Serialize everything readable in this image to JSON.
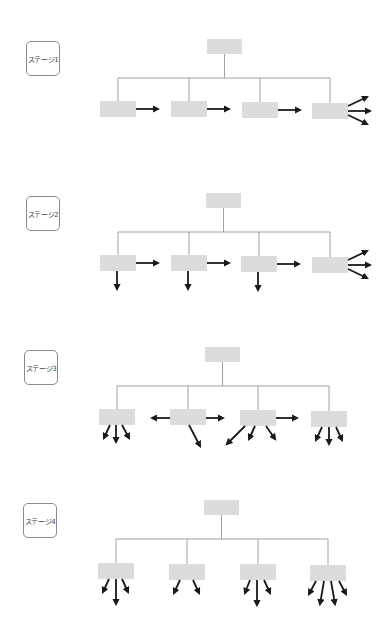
{
  "colors": {
    "node_fill": "#dcdcdc",
    "connector": "#8c8c8c",
    "arrow": "#1a1a1a",
    "label_border": "#8a8a8a",
    "label_text": "#444444"
  },
  "stages": [
    {
      "label": "ステージ1",
      "top": 0,
      "label_box": {
        "x": 26,
        "y": 41
      },
      "root": {
        "x": 207,
        "y": 39,
        "w": 35,
        "h": 15
      },
      "bus_y": 78,
      "children": [
        {
          "x": 100,
          "y": 101,
          "w": 36,
          "h": 16
        },
        {
          "x": 171,
          "y": 101,
          "w": 36,
          "h": 16
        },
        {
          "x": 242,
          "y": 102,
          "w": 36,
          "h": 16
        },
        {
          "x": 312,
          "y": 103,
          "w": 36,
          "h": 16
        }
      ],
      "arrows": [
        {
          "x1": 136,
          "y1": 109,
          "x2": 158,
          "y2": 109
        },
        {
          "x1": 207,
          "y1": 109,
          "x2": 229,
          "y2": 109
        },
        {
          "x1": 278,
          "y1": 110,
          "x2": 300,
          "y2": 110
        },
        {
          "x1": 348,
          "y1": 106,
          "x2": 367,
          "y2": 97
        },
        {
          "x1": 348,
          "y1": 111,
          "x2": 370,
          "y2": 111
        },
        {
          "x1": 348,
          "y1": 115,
          "x2": 367,
          "y2": 124
        }
      ]
    },
    {
      "label": "ステージ2",
      "top": 0,
      "label_box": {
        "x": 26,
        "y": 196
      },
      "root": {
        "x": 206,
        "y": 193,
        "w": 35,
        "h": 15
      },
      "bus_y": 232,
      "children": [
        {
          "x": 100,
          "y": 255,
          "w": 36,
          "h": 16
        },
        {
          "x": 171,
          "y": 255,
          "w": 36,
          "h": 16
        },
        {
          "x": 241,
          "y": 256,
          "w": 36,
          "h": 16
        },
        {
          "x": 312,
          "y": 257,
          "w": 36,
          "h": 16
        }
      ],
      "arrows": [
        {
          "x1": 136,
          "y1": 263,
          "x2": 158,
          "y2": 263
        },
        {
          "x1": 207,
          "y1": 263,
          "x2": 229,
          "y2": 263
        },
        {
          "x1": 277,
          "y1": 264,
          "x2": 299,
          "y2": 264
        },
        {
          "x1": 348,
          "y1": 260,
          "x2": 367,
          "y2": 251
        },
        {
          "x1": 348,
          "y1": 265,
          "x2": 370,
          "y2": 265
        },
        {
          "x1": 348,
          "y1": 269,
          "x2": 367,
          "y2": 278
        },
        {
          "x1": 117,
          "y1": 271,
          "x2": 117,
          "y2": 289
        },
        {
          "x1": 188,
          "y1": 271,
          "x2": 188,
          "y2": 289
        },
        {
          "x1": 258,
          "y1": 272,
          "x2": 258,
          "y2": 290
        }
      ]
    },
    {
      "label": "ステージ3",
      "top": 0,
      "label_box": {
        "x": 24,
        "y": 350
      },
      "root": {
        "x": 205,
        "y": 347,
        "w": 35,
        "h": 15
      },
      "bus_y": 386,
      "children": [
        {
          "x": 99,
          "y": 409,
          "w": 36,
          "h": 16
        },
        {
          "x": 170,
          "y": 409,
          "w": 36,
          "h": 16
        },
        {
          "x": 240,
          "y": 410,
          "w": 36,
          "h": 16
        },
        {
          "x": 311,
          "y": 411,
          "w": 36,
          "h": 16
        }
      ],
      "arrows": [
        {
          "x1": 110,
          "y1": 425,
          "x2": 104,
          "y2": 438
        },
        {
          "x1": 116,
          "y1": 425,
          "x2": 116,
          "y2": 442
        },
        {
          "x1": 122,
          "y1": 425,
          "x2": 129,
          "y2": 438
        },
        {
          "x1": 170,
          "y1": 418,
          "x2": 152,
          "y2": 418
        },
        {
          "x1": 206,
          "y1": 418,
          "x2": 223,
          "y2": 418
        },
        {
          "x1": 189,
          "y1": 425,
          "x2": 200,
          "y2": 446
        },
        {
          "x1": 276,
          "y1": 418,
          "x2": 297,
          "y2": 418
        },
        {
          "x1": 245,
          "y1": 426,
          "x2": 227,
          "y2": 444
        },
        {
          "x1": 255,
          "y1": 426,
          "x2": 249,
          "y2": 439
        },
        {
          "x1": 266,
          "y1": 426,
          "x2": 275,
          "y2": 439
        },
        {
          "x1": 322,
          "y1": 427,
          "x2": 316,
          "y2": 440
        },
        {
          "x1": 329,
          "y1": 427,
          "x2": 329,
          "y2": 444
        },
        {
          "x1": 336,
          "y1": 427,
          "x2": 342,
          "y2": 440
        }
      ]
    },
    {
      "label": "ステージ4",
      "top": 0,
      "label_box": {
        "x": 23,
        "y": 503
      },
      "root": {
        "x": 204,
        "y": 500,
        "w": 35,
        "h": 15
      },
      "bus_y": 539,
      "children": [
        {
          "x": 98,
          "y": 563,
          "w": 36,
          "h": 16
        },
        {
          "x": 169,
          "y": 564,
          "w": 36,
          "h": 16
        },
        {
          "x": 240,
          "y": 564,
          "w": 36,
          "h": 16
        },
        {
          "x": 310,
          "y": 565,
          "w": 36,
          "h": 16
        }
      ],
      "arrows": [
        {
          "x1": 109,
          "y1": 579,
          "x2": 103,
          "y2": 592
        },
        {
          "x1": 116,
          "y1": 579,
          "x2": 116,
          "y2": 604
        },
        {
          "x1": 122,
          "y1": 579,
          "x2": 128,
          "y2": 592
        },
        {
          "x1": 180,
          "y1": 580,
          "x2": 174,
          "y2": 593
        },
        {
          "x1": 193,
          "y1": 580,
          "x2": 199,
          "y2": 593
        },
        {
          "x1": 250,
          "y1": 580,
          "x2": 245,
          "y2": 593
        },
        {
          "x1": 257,
          "y1": 580,
          "x2": 257,
          "y2": 605
        },
        {
          "x1": 264,
          "y1": 580,
          "x2": 270,
          "y2": 593
        },
        {
          "x1": 316,
          "y1": 581,
          "x2": 309,
          "y2": 594
        },
        {
          "x1": 324,
          "y1": 581,
          "x2": 320,
          "y2": 604
        },
        {
          "x1": 331,
          "y1": 581,
          "x2": 335,
          "y2": 604
        },
        {
          "x1": 339,
          "y1": 581,
          "x2": 346,
          "y2": 594
        }
      ]
    }
  ]
}
